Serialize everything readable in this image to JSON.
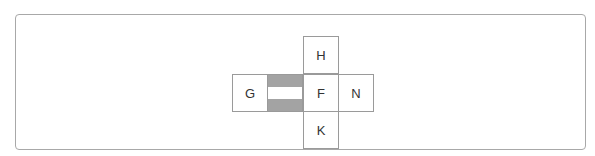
{
  "diagram": {
    "type": "cube-net",
    "faces": [
      {
        "id": "H",
        "label": "H",
        "position": "top"
      },
      {
        "id": "G",
        "label": "G",
        "position": "far-left"
      },
      {
        "id": "striped",
        "label": "",
        "position": "left",
        "pattern": "two gray horizontal bands with white center"
      },
      {
        "id": "F",
        "label": "F",
        "position": "center"
      },
      {
        "id": "N",
        "label": "N",
        "position": "right"
      },
      {
        "id": "K",
        "label": "K",
        "position": "bottom"
      }
    ],
    "colors": {
      "border": "#9a9a9a",
      "band": "#a3a3a3",
      "text": "#333333"
    }
  }
}
